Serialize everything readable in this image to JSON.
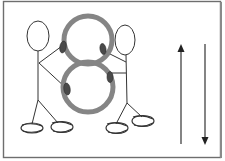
{
  "diagram": {
    "description_labels": [],
    "colors": {
      "background": "#ffffff",
      "frame": "#6e6e6e",
      "ink": "#333333",
      "loop": "#858585",
      "grip": "#4a4a4a"
    },
    "frame": {
      "x": 3,
      "y": 1,
      "width": 218,
      "height": 157
    },
    "figure_eight": {
      "top_circle": {
        "cx": 88,
        "cy": 40,
        "r": 24
      },
      "bottom_circle": {
        "cx": 88,
        "cy": 87,
        "r": 25
      },
      "grips": [
        {
          "cx": 62,
          "cy": 47
        },
        {
          "cx": 103,
          "cy": 49
        },
        {
          "cx": 67,
          "cy": 89
        },
        {
          "cx": 109,
          "cy": 77
        }
      ]
    },
    "stick_figures": [
      {
        "name": "left",
        "head": {
          "cx": 38,
          "cy": 36,
          "rx": 11,
          "ry": 15
        }
      },
      {
        "name": "right",
        "head": {
          "cx": 125,
          "cy": 40,
          "rx": 10,
          "ry": 15
        }
      }
    ],
    "arrows": [
      {
        "direction": "up",
        "x": 181,
        "y_from": 144,
        "y_to": 45
      },
      {
        "direction": "down",
        "x": 205,
        "y_from": 44,
        "y_to": 144
      }
    ]
  }
}
